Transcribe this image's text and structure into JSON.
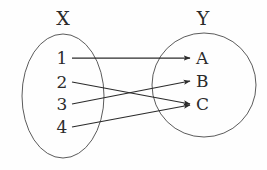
{
  "diagram": {
    "type": "set-mapping-diagram",
    "background_color": "#fefefe",
    "outline_color": "#5b5b5b",
    "arrow_color": "#2b2b2b",
    "text_color": "#2b2b2b",
    "domain_set": {
      "title": "X",
      "title_x": 63,
      "title_y": 25,
      "shape": "ellipse",
      "cx": 63,
      "cy": 96,
      "rx": 41,
      "ry": 62,
      "elements": [
        {
          "label": "1",
          "x": 62,
          "y": 64,
          "node_x": 72,
          "node_y": 58
        },
        {
          "label": "2",
          "x": 62,
          "y": 88,
          "node_x": 72,
          "node_y": 82
        },
        {
          "label": "3",
          "x": 62,
          "y": 110,
          "node_x": 72,
          "node_y": 104
        },
        {
          "label": "4",
          "x": 62,
          "y": 133,
          "node_x": 72,
          "node_y": 127
        }
      ]
    },
    "codomain_set": {
      "title": "Y",
      "title_x": 203,
      "title_y": 25,
      "shape": "circle",
      "cx": 204,
      "cy": 85,
      "rx": 52,
      "ry": 52,
      "elements": [
        {
          "label": "A",
          "x": 196,
          "y": 64,
          "node_x": 192,
          "node_y": 58
        },
        {
          "label": "B",
          "x": 196,
          "y": 87,
          "node_x": 192,
          "node_y": 81
        },
        {
          "label": "C",
          "x": 196,
          "y": 110,
          "node_x": 192,
          "node_y": 104
        }
      ]
    },
    "mappings": [
      {
        "from": "1",
        "to": "A",
        "x1": 72,
        "y1": 58,
        "x2": 190,
        "y2": 58
      },
      {
        "from": "2",
        "to": "C",
        "x1": 72,
        "y1": 82,
        "x2": 190,
        "y2": 104
      },
      {
        "from": "3",
        "to": "B",
        "x1": 72,
        "y1": 104,
        "x2": 190,
        "y2": 81
      },
      {
        "from": "4",
        "to": "C",
        "x1": 72,
        "y1": 127,
        "x2": 190,
        "y2": 105
      }
    ]
  }
}
